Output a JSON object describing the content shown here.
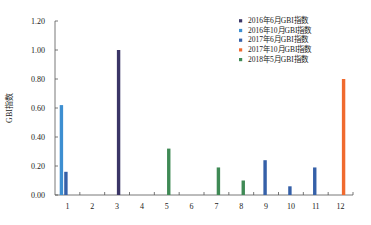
{
  "chart_data": {
    "type": "bar",
    "title": "",
    "xlabel": "",
    "ylabel": "GBI指数",
    "ylim": [
      0,
      1.2
    ],
    "yticks": [
      "0.00",
      "0.20",
      "0.40",
      "0.60",
      "0.80",
      "1.00",
      "1.20"
    ],
    "categories": [
      "1",
      "2",
      "3",
      "4",
      "5",
      "6",
      "7",
      "8",
      "9",
      "10",
      "11",
      "12"
    ],
    "grid": false,
    "legend_position": "upper right",
    "series": [
      {
        "name": "2016年6月GBI指数",
        "color": "#3a3566",
        "values": [
          null,
          null,
          1.0,
          null,
          null,
          null,
          null,
          null,
          null,
          null,
          null,
          null
        ]
      },
      {
        "name": "2016年10月GBI指数",
        "color": "#3d8fd1",
        "values": [
          0.62,
          null,
          null,
          null,
          null,
          null,
          null,
          null,
          null,
          null,
          null,
          null
        ]
      },
      {
        "name": "2017年6月GBI指数",
        "color": "#3560a8",
        "values": [
          0.16,
          null,
          null,
          null,
          null,
          null,
          null,
          null,
          0.24,
          0.06,
          0.19,
          null
        ]
      },
      {
        "name": "2017年10月GBI指数",
        "color": "#f06a2e",
        "values": [
          null,
          null,
          null,
          null,
          null,
          null,
          null,
          null,
          null,
          null,
          null,
          0.8
        ]
      },
      {
        "name": "2018年5月GBI指数",
        "color": "#3f8a55",
        "values": [
          null,
          null,
          null,
          null,
          0.32,
          null,
          0.19,
          0.1,
          null,
          null,
          null,
          null
        ]
      }
    ]
  }
}
